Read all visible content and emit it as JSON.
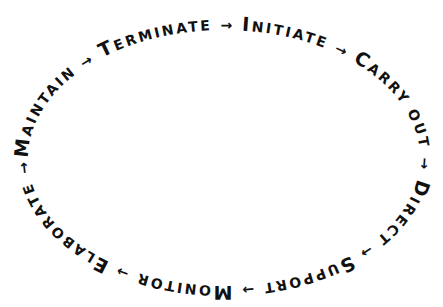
{
  "diagram": {
    "type": "cycle",
    "direction": "clockwise",
    "stages": [
      {
        "initial": "I",
        "rest": "NITIATE",
        "label": "Initiate"
      },
      {
        "initial": "C",
        "rest": "ARRY OUT",
        "label": "Carry Out"
      },
      {
        "initial": "D",
        "rest": "IRECT",
        "label": "Direct"
      },
      {
        "initial": "S",
        "rest": "UPPORT",
        "label": "Support"
      },
      {
        "initial": "M",
        "rest": "ONITOR",
        "label": "Monitor"
      },
      {
        "initial": "E",
        "rest": "LABORATE",
        "label": "Elaborate"
      },
      {
        "initial": "M",
        "rest": "AINTAIN",
        "label": "Maintain"
      },
      {
        "initial": "T",
        "rest": "ERMINATE",
        "label": "Terminate"
      }
    ],
    "connector": "→",
    "text_color": "#111111",
    "background": "#ffffff"
  }
}
